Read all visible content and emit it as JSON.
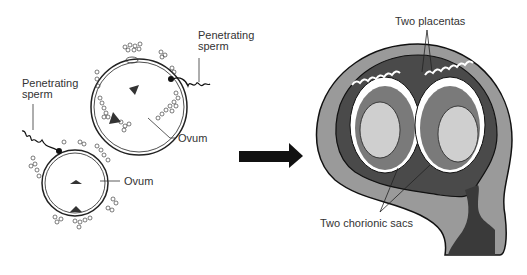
{
  "left_panel": {
    "upper_ovum": {
      "sperm_label_line1": "Penetrating",
      "sperm_label_line2": "sperm",
      "ovum_label": "Ovum"
    },
    "lower_ovum": {
      "sperm_label_line1": "Penetrating",
      "sperm_label_line2": "sperm",
      "ovum_label": "Ovum"
    }
  },
  "arrow": {
    "direction": "right",
    "color": "#111111"
  },
  "right_panel": {
    "placentas_label": "Two placentas",
    "sacs_label": "Two chorionic sacs"
  },
  "colors": {
    "uterus_wall": "#9a9a9a",
    "cavity_dark": "#4a4a4a",
    "sac_mid": "#7a7a7a",
    "embryo": "#cfcfcf",
    "outline": "#111111"
  }
}
